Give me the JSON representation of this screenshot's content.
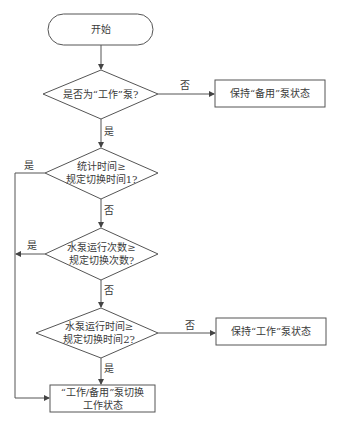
{
  "flowchart": {
    "nodes": {
      "start": {
        "label": "开始"
      },
      "is_working_pump": {
        "label": "是否为“工作”泵?"
      },
      "keep_standby": {
        "label": "保持“备用”泵状态"
      },
      "stat_time": {
        "line1": "统计时间≥",
        "line2": "规定切换时间1?"
      },
      "run_count": {
        "line1": "水泵运行次数≥",
        "line2": "规定切换次数?"
      },
      "run_time": {
        "line1": "水泵运行时间≥",
        "line2": "规定切换时间2?"
      },
      "keep_working": {
        "label": "保持“工作”泵状态"
      },
      "switch_state": {
        "line1": "“工作/备用”泵切换",
        "line2": "工作状态"
      }
    },
    "edge_labels": {
      "d1_no": "否",
      "d1_yes": "是",
      "d2_yes": "是",
      "d2_no": "否",
      "d3_yes": "是",
      "d3_no": "否",
      "d4_no": "否",
      "d4_yes": "是"
    },
    "colors": {
      "stroke": "#555555",
      "text": "#3a3a3a",
      "background": "#ffffff"
    }
  }
}
